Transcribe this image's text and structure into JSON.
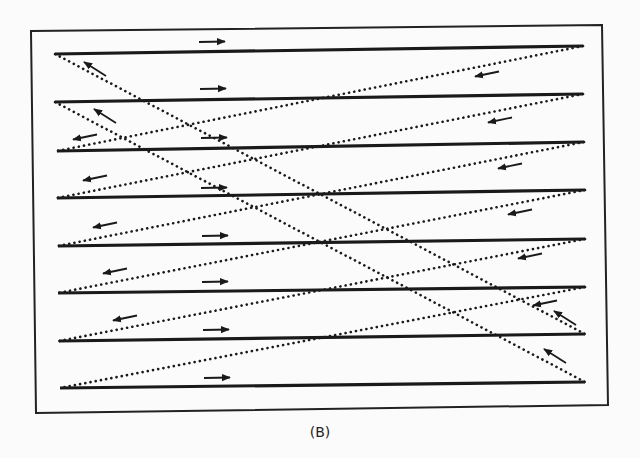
{
  "figure": {
    "caption": "(B)",
    "colors": {
      "ink": "#1a1a1a",
      "frame": "#222222",
      "background": "#fbfbfb"
    },
    "frame": {
      "tl": [
        31,
        31
      ],
      "tr": [
        602,
        25
      ],
      "br": [
        608,
        405
      ],
      "bl": [
        36,
        413
      ]
    },
    "scan_lines": [
      {
        "index": 1,
        "left": [
          55,
          54
        ],
        "right": [
          583,
          46
        ],
        "direction": "right"
      },
      {
        "index": 2,
        "left": [
          55,
          102
        ],
        "right": [
          583,
          94
        ],
        "direction": "right"
      },
      {
        "index": 3,
        "left": [
          57,
          151
        ],
        "right": [
          584,
          142
        ],
        "direction": "right"
      },
      {
        "index": 4,
        "left": [
          57,
          198
        ],
        "right": [
          585,
          190
        ],
        "direction": "right"
      },
      {
        "index": 5,
        "left": [
          58,
          246
        ],
        "right": [
          585,
          239
        ],
        "direction": "right"
      },
      {
        "index": 6,
        "left": [
          58,
          293
        ],
        "right": [
          585,
          287
        ],
        "direction": "right"
      },
      {
        "index": 7,
        "left": [
          59,
          341
        ],
        "right": [
          585,
          334
        ],
        "direction": "right"
      },
      {
        "index": 8,
        "left": [
          60,
          388
        ],
        "right": [
          585,
          382
        ],
        "direction": "right"
      }
    ],
    "retrace_lines": [
      {
        "from": [
          583,
          46
        ],
        "to": [
          57,
          151
        ],
        "direction": "left"
      },
      {
        "from": [
          583,
          94
        ],
        "to": [
          57,
          198
        ],
        "direction": "left"
      },
      {
        "from": [
          584,
          142
        ],
        "to": [
          58,
          246
        ],
        "direction": "left"
      },
      {
        "from": [
          585,
          190
        ],
        "to": [
          58,
          293
        ],
        "direction": "left"
      },
      {
        "from": [
          585,
          239
        ],
        "to": [
          59,
          341
        ],
        "direction": "left"
      },
      {
        "from": [
          585,
          287
        ],
        "to": [
          60,
          388
        ],
        "direction": "left"
      }
    ],
    "diagonal_retraces": [
      {
        "from": [
          55,
          54
        ],
        "to": [
          585,
          334
        ],
        "direction": "up-left"
      },
      {
        "from": [
          55,
          102
        ],
        "to": [
          585,
          382
        ],
        "direction": "up-left"
      }
    ],
    "right_arrows": [
      {
        "x": 212,
        "y": 42
      },
      {
        "x": 213,
        "y": 89
      },
      {
        "x": 214,
        "y": 138
      },
      {
        "x": 214,
        "y": 188
      },
      {
        "x": 215,
        "y": 236
      },
      {
        "x": 215,
        "y": 282
      },
      {
        "x": 216,
        "y": 330
      },
      {
        "x": 217,
        "y": 378
      }
    ],
    "left_arrows": [
      {
        "x": 487,
        "y": 74
      },
      {
        "x": 500,
        "y": 120
      },
      {
        "x": 510,
        "y": 166
      },
      {
        "x": 520,
        "y": 212
      },
      {
        "x": 530,
        "y": 256
      },
      {
        "x": 545,
        "y": 303
      },
      {
        "x": 85,
        "y": 137
      },
      {
        "x": 95,
        "y": 178
      },
      {
        "x": 105,
        "y": 225
      },
      {
        "x": 115,
        "y": 271
      },
      {
        "x": 125,
        "y": 318
      }
    ],
    "diagonal_arrows": [
      {
        "x": 95,
        "y": 68,
        "along": 0
      },
      {
        "x": 105,
        "y": 115,
        "along": 1
      },
      {
        "x": 565,
        "y": 317,
        "along": 0
      },
      {
        "x": 555,
        "y": 355,
        "along": 1
      }
    ]
  }
}
